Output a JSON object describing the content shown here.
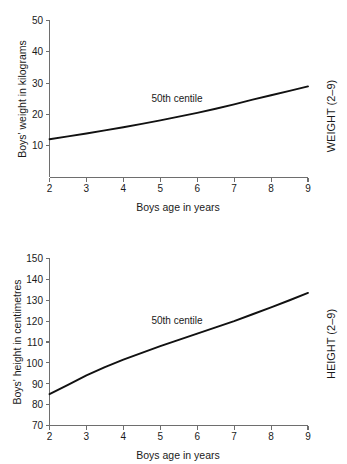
{
  "chart_data": [
    {
      "type": "line",
      "id": "weight-chart",
      "title": "",
      "side_label": "WEIGHT (2–9)",
      "xlabel": "Boys age in years",
      "ylabel": "Boys' weight in kilograms",
      "xlim": [
        2,
        9
      ],
      "ylim": [
        0,
        50
      ],
      "xticks": [
        2,
        3,
        4,
        5,
        6,
        7,
        8,
        9
      ],
      "xtick_labels": [
        "2",
        "3",
        "4",
        "5",
        "6",
        "7",
        "8",
        "9"
      ],
      "yticks": [
        10,
        20,
        30,
        40,
        50
      ],
      "ytick_labels": [
        "10",
        "20",
        "30",
        "40",
        "50"
      ],
      "grid": false,
      "legend": "none",
      "annotations": [
        {
          "text": "50th centile",
          "x": 4.6,
          "y": 22.5
        }
      ],
      "series": [
        {
          "name": "50th centile",
          "x": [
            2.0,
            2.5,
            3.0,
            3.5,
            4.0,
            4.5,
            5.0,
            5.5,
            6.0,
            6.5,
            7.0,
            7.5,
            8.0,
            8.5,
            9.0
          ],
          "values": [
            12.2,
            13.1,
            14.0,
            15.0,
            16.0,
            17.1,
            18.2,
            19.4,
            20.6,
            21.9,
            23.3,
            24.8,
            26.2,
            27.6,
            29.0
          ]
        }
      ]
    },
    {
      "type": "line",
      "id": "height-chart",
      "title": "",
      "side_label": "HEIGHT (2–9)",
      "xlabel": "Boys age in years",
      "ylabel": "Boys' height in centimetres",
      "xlim": [
        2,
        9
      ],
      "ylim": [
        70,
        150
      ],
      "xticks": [
        2,
        3,
        4,
        5,
        6,
        7,
        8,
        9
      ],
      "xtick_labels": [
        "2",
        "3",
        "4",
        "5",
        "6",
        "7",
        "8",
        "9"
      ],
      "yticks": [
        70,
        80,
        90,
        100,
        110,
        120,
        130,
        140,
        150
      ],
      "ytick_labels": [
        "70",
        "80",
        "90",
        "100",
        "110",
        "120",
        "130",
        "140",
        "150"
      ],
      "grid": false,
      "legend": "none",
      "annotations": [
        {
          "text": "50th centile",
          "x": 4.5,
          "y": 118.5
        }
      ],
      "series": [
        {
          "name": "50th centile",
          "x": [
            2.0,
            2.5,
            3.0,
            3.5,
            4.0,
            4.5,
            5.0,
            5.5,
            6.0,
            6.5,
            7.0,
            7.5,
            8.0,
            8.5,
            9.0
          ],
          "values": [
            85.0,
            89.5,
            94.0,
            98.0,
            101.5,
            104.8,
            108.0,
            111.0,
            114.0,
            117.0,
            120.0,
            123.3,
            126.6,
            130.0,
            133.5
          ]
        }
      ]
    }
  ],
  "weight": {
    "ylabel": "Boys' weight in kilograms",
    "xlabel": "Boys age in years",
    "side_label": "WEIGHT (2–9)",
    "centile_label": "50th centile",
    "yticks": [
      "50",
      "40",
      "30",
      "20",
      "10"
    ],
    "xticks": [
      "2",
      "3",
      "4",
      "5",
      "6",
      "7",
      "8",
      "9"
    ]
  },
  "height": {
    "ylabel": "Boys' height in centimetres",
    "xlabel": "Boys age in years",
    "side_label": "HEIGHT (2–9)",
    "centile_label": "50th centile",
    "yticks": [
      "150",
      "140",
      "130",
      "120",
      "110",
      "100",
      "90",
      "80",
      "70"
    ],
    "xticks": [
      "2",
      "3",
      "4",
      "5",
      "6",
      "7",
      "8",
      "9"
    ]
  },
  "colors": {
    "curve": "#111111",
    "axis": "#6e6e6e",
    "text": "#1a1a1a",
    "background": "#ffffff"
  }
}
